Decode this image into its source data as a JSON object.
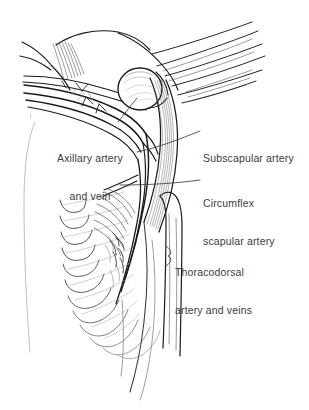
{
  "figure": {
    "background_color": "#ffffff",
    "ink_color": "#1a1a1a",
    "text_color": "#3b3b3d",
    "light_ink_color": "#b4b4b8",
    "width": 309,
    "height": 410
  },
  "labels": {
    "axillary": {
      "line1": "Axillary artery",
      "line2": "and vein"
    },
    "subscapular": {
      "line1": "Subscapular artery"
    },
    "circumflex": {
      "line1": "Circumflex",
      "line2": "scapular artery"
    },
    "thoracodorsal": {
      "line1": "Thoracodorsal",
      "line2": "artery and veins"
    }
  },
  "structures": {
    "humeral_head": "humeral-head",
    "subscapularis_muscle": "subscapularis-muscle",
    "serratus_anterior": "serratus-anterior-digitations",
    "chest_wall": "chest-wall-contour",
    "axillary_vessels": "axillary-vessel-bundle",
    "thoracodorsal_vessels": "thoracodorsal-vessel-bundle",
    "latissimus_border": "latissimus-dorsi-border"
  }
}
